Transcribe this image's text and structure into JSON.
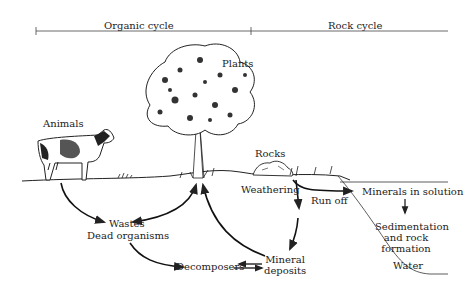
{
  "header": {
    "organic_cycle": "Organic cycle",
    "rock_cycle": "Rock cycle"
  },
  "labels": {
    "animals": "Animals",
    "plants": "Plants",
    "rocks": "Rocks",
    "weathering": "Weathering",
    "run_off": "Run off",
    "minerals_in_solution": "Minerals in solution",
    "sedimentation_1": "Sedimentation",
    "sedimentation_2": "and rock",
    "sedimentation_3": "formation",
    "wastes": "Wastes",
    "dead_organisms": "Dead organisms",
    "decomposers": "Decomposers",
    "mineral_1": "Mineral",
    "mineral_2": "deposits",
    "water": "Water"
  },
  "colors": {
    "ink": "#222222",
    "background": "#ffffff"
  }
}
